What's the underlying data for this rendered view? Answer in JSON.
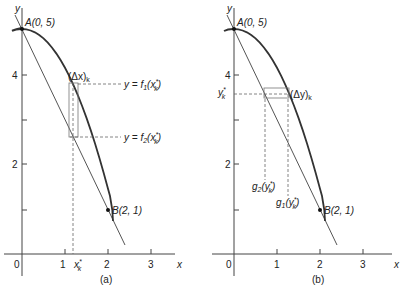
{
  "figure": {
    "panels": [
      {
        "id": "a",
        "caption": "(a)",
        "axis_labels": {
          "x": "x",
          "y": "y"
        },
        "x_ticks": [
          "0",
          "1",
          "2",
          "3"
        ],
        "y_ticks": [
          "2",
          "4"
        ],
        "point_a": "A(0, 5)",
        "point_b": "B(2, 1)",
        "strip_label": "(Δx)",
        "strip_label_sub": "k",
        "xk_label": "x",
        "xk_sup": "*",
        "xk_sub": "k",
        "upper_label": "y = f",
        "upper_label_sub": "1",
        "upper_label_arg": "(x",
        "lower_label": "y = f",
        "lower_label_sub": "2",
        "lower_label_arg": "(x",
        "arg_sup": "*",
        "arg_sub": "k",
        "close_paren": ")"
      },
      {
        "id": "b",
        "caption": "(b)",
        "axis_labels": {
          "x": "x",
          "y": "y"
        },
        "x_ticks": [
          "0",
          "1",
          "2",
          "3"
        ],
        "y_ticks": [
          "2",
          "4"
        ],
        "point_a": "A(0, 5)",
        "point_b": "B(2, 1)",
        "strip_label": "(Δy)",
        "strip_label_sub": "k",
        "yk_label": "y",
        "yk_sup": "*",
        "yk_sub": "k",
        "g2_label": "g",
        "g2_sub": "2",
        "g1_label": "g",
        "g1_sub": "1",
        "g_arg": "(y",
        "g_sup": "*",
        "g_sub": "k",
        "close_paren": ")"
      }
    ],
    "colors": {
      "curve": "#333333",
      "line": "#555555",
      "axis": "#444444",
      "dash": "#666666"
    }
  }
}
